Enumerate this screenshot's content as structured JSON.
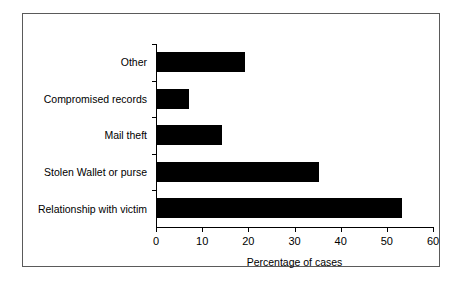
{
  "chart_data": {
    "type": "bar",
    "orientation": "horizontal",
    "title": "",
    "xlabel": "Percentage of cases",
    "ylabel": "",
    "categories": [
      "Other",
      "Compromised records",
      "Mail theft",
      "Stolen Wallet or purse",
      "Relationship with victim"
    ],
    "values": [
      19,
      7,
      14,
      35,
      53
    ],
    "xlim": [
      0,
      60
    ],
    "xticks": [
      0,
      10,
      20,
      30,
      40,
      50,
      60
    ],
    "xtick_labels": [
      "0",
      "10",
      "20",
      "30",
      "40",
      "50",
      "60"
    ],
    "grid": false,
    "legend": false,
    "bar_color": "#000000",
    "axis_color": "#000000",
    "background_color": "#ffffff",
    "frame_color": "#5a5a5a"
  }
}
